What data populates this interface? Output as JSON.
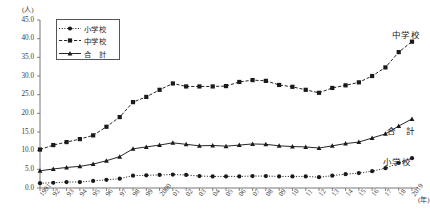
{
  "chart_data": {
    "type": "line",
    "title": "",
    "xlabel": "(年)",
    "ylabel": "(人)",
    "ylim": [
      0.0,
      45.0
    ],
    "ytick_step": 5.0,
    "yticks": [
      "45.0",
      "40.0",
      "35.0",
      "30.0",
      "25.0",
      "20.0",
      "15.0",
      "10.0",
      "5.0",
      "0.0"
    ],
    "grid": false,
    "legend_position": "top-left-inside",
    "categories": [
      "1991",
      "92",
      "93",
      "94",
      "95",
      "96",
      "97",
      "98",
      "99",
      "2000",
      "01",
      "02",
      "03",
      "04",
      "05",
      "06",
      "07",
      "08",
      "09",
      "10",
      "11",
      "12",
      "13",
      "14",
      "15",
      "16",
      "17",
      "18",
      "2019"
    ],
    "series": [
      {
        "name": "小学校",
        "marker": "circle",
        "linestyle": "dotted",
        "color": "#1a1a1a",
        "values": [
          1.3,
          1.4,
          1.6,
          1.6,
          1.9,
          2.2,
          2.5,
          3.3,
          3.4,
          3.5,
          3.6,
          3.5,
          3.2,
          3.1,
          3.1,
          3.1,
          3.2,
          3.2,
          3.1,
          3.1,
          3.1,
          2.9,
          3.3,
          3.7,
          4.0,
          4.5,
          5.3,
          6.7,
          8.0
        ]
      },
      {
        "name": "中学校",
        "marker": "square",
        "linestyle": "dashed",
        "color": "#1a1a1a",
        "values": [
          10.3,
          11.5,
          12.3,
          13.1,
          14.1,
          16.4,
          19.0,
          23.0,
          24.4,
          26.3,
          28.0,
          27.2,
          27.2,
          27.2,
          27.3,
          28.4,
          28.9,
          28.7,
          27.6,
          27.1,
          26.3,
          25.5,
          26.8,
          27.5,
          28.3,
          30.0,
          32.3,
          36.4,
          39.2
        ]
      },
      {
        "name": "合　計",
        "marker": "triangle",
        "linestyle": "solid",
        "color": "#1a1a1a",
        "values": [
          4.6,
          5.1,
          5.5,
          5.8,
          6.4,
          7.3,
          8.4,
          10.5,
          11.0,
          11.5,
          12.1,
          11.7,
          11.3,
          11.4,
          11.2,
          11.5,
          11.8,
          11.7,
          11.3,
          11.1,
          11.0,
          10.7,
          11.3,
          11.9,
          12.3,
          13.4,
          14.5,
          16.6,
          18.5
        ]
      }
    ],
    "annotations": [
      {
        "name": "中学校",
        "x": 420,
        "y": 28
      },
      {
        "name": "合　計",
        "x": 415,
        "y": 124
      },
      {
        "name": "小学校",
        "x": 411,
        "y": 155
      }
    ]
  },
  "legend": {
    "items": [
      {
        "label": "小学校",
        "style": "dotted-circle"
      },
      {
        "label": "中学校",
        "style": "dashed-square"
      },
      {
        "label": "合　計",
        "style": "solid-triangle"
      }
    ]
  }
}
